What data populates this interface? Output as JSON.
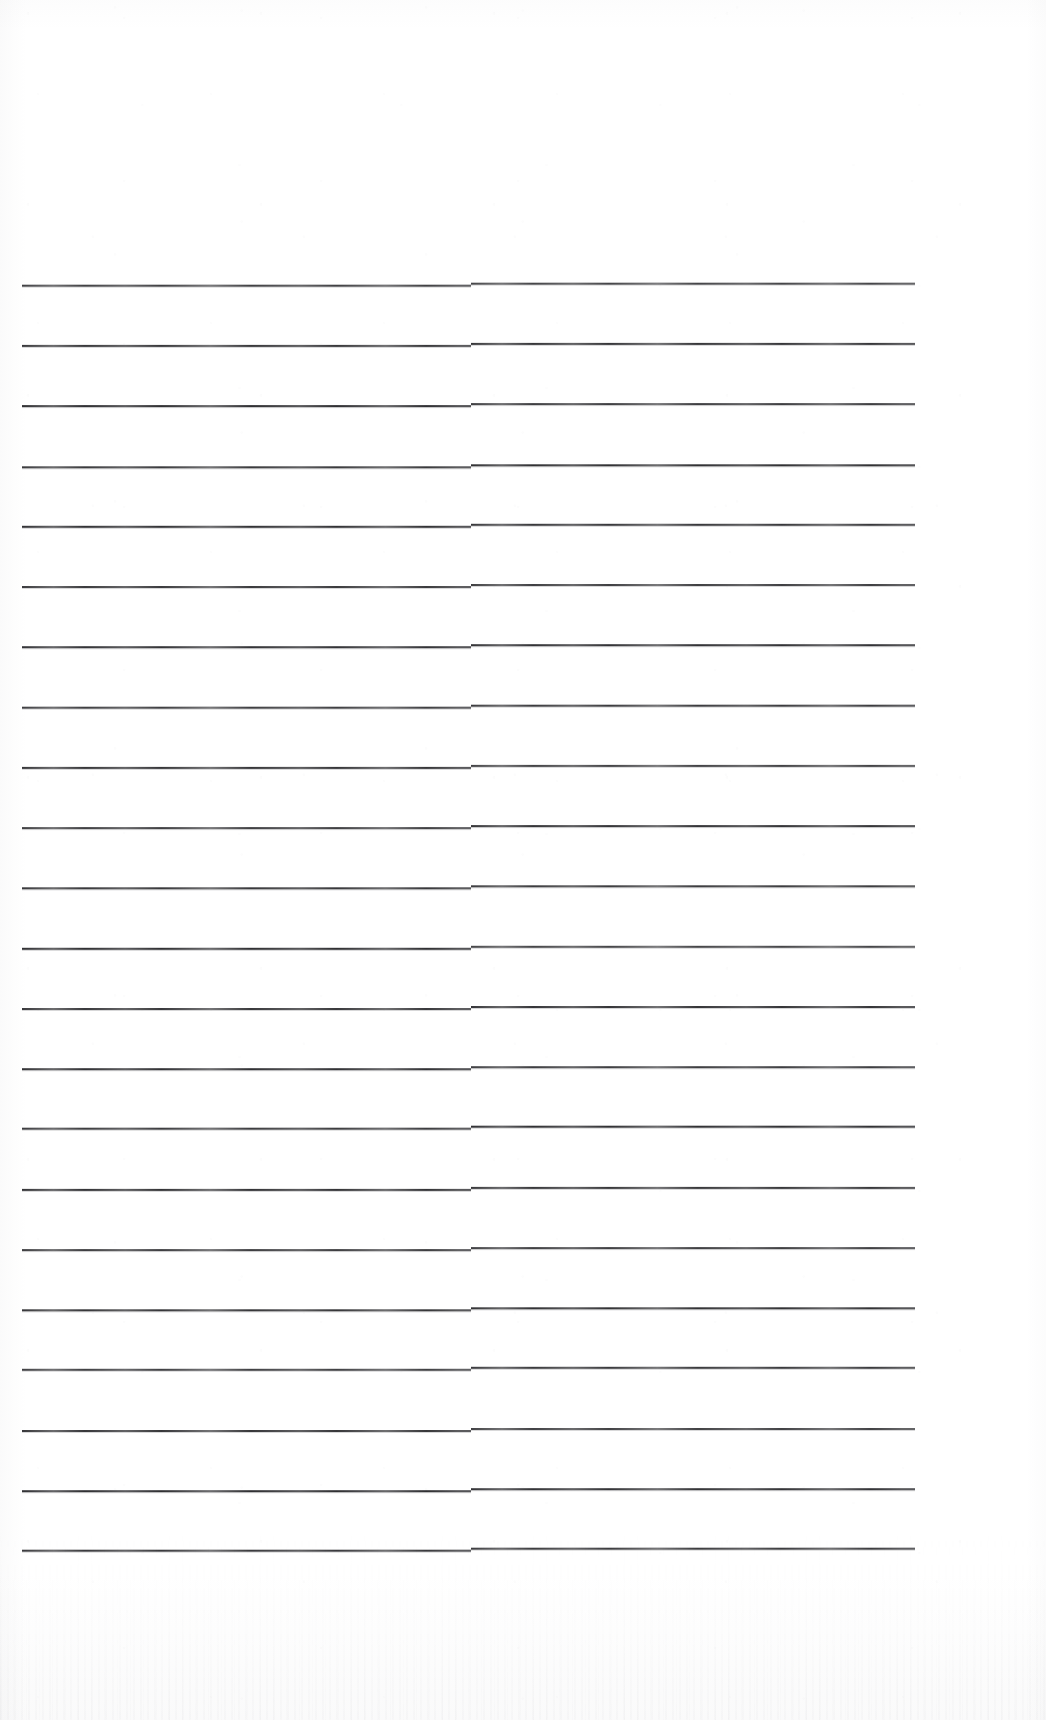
{
  "document": {
    "kind": "scanned-lined-notebook-page",
    "title": "Blank ruled notebook page",
    "page_width": 1046,
    "page_height": 1720,
    "background_color": "#ffffff",
    "rule_color": "#2b2b2e",
    "content_text": "",
    "visible_text_count": 0,
    "notes": "No handwriting, headings, numbers or labels are present on the page."
  },
  "ruling": {
    "line_count": 22,
    "first_line_y": 285,
    "last_line_y": 1550,
    "line_spacing": 60.2,
    "line_thickness": 2,
    "left_margin_x": 22,
    "right_edge_x": 915,
    "segment_break_x": 471,
    "segment_vertical_offset": 2,
    "lines_y": [
      285,
      345,
      405,
      466,
      526,
      586,
      646,
      707,
      767,
      827,
      887,
      948,
      1008,
      1068,
      1128,
      1189,
      1249,
      1309,
      1369,
      1430,
      1490,
      1550
    ]
  },
  "margins": {
    "top_blank_height": 285,
    "bottom_blank_height": 170,
    "left_blank_width": 22,
    "right_blank_width": 131
  },
  "scan_artifacts": {
    "grain": "faint grey speckle across sheet",
    "bottom_band": "grey scanner noise band along lower edge",
    "edge_shadow": "subtle darkening at left and bottom edges"
  }
}
